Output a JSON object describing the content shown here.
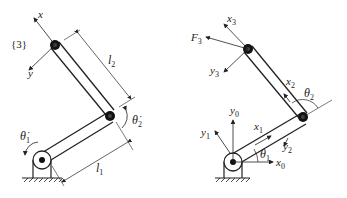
{
  "left_diagram": {
    "frame_label": "{3}",
    "axis_x": "x",
    "axis_y": "y",
    "link2_length": "l",
    "link2_length_sub": "2",
    "link1_length": "l",
    "link1_length_sub": "1",
    "theta1_dot": "θ̇",
    "theta1_dot_sub": "1",
    "theta2_dot": "θ̇",
    "theta2_dot_sub": "2"
  },
  "right_diagram": {
    "x3": "x",
    "x3_sub": "3",
    "y3": "y",
    "y3_sub": "3",
    "F3": "F",
    "F3_sub": "3",
    "x2": "x",
    "x2_sub": "2",
    "y2": "y",
    "y2_sub": "2",
    "theta2": "θ",
    "theta2_sub": "2",
    "y0": "y",
    "y0_sub": "0",
    "y1": "y",
    "y1_sub": "1",
    "x1": "x",
    "x1_sub": "1",
    "theta1": "θ",
    "theta1_sub": "1",
    "x0": "x",
    "x0_sub": "0"
  },
  "colors": {
    "ink": "#222222",
    "background": "#ffffff"
  }
}
